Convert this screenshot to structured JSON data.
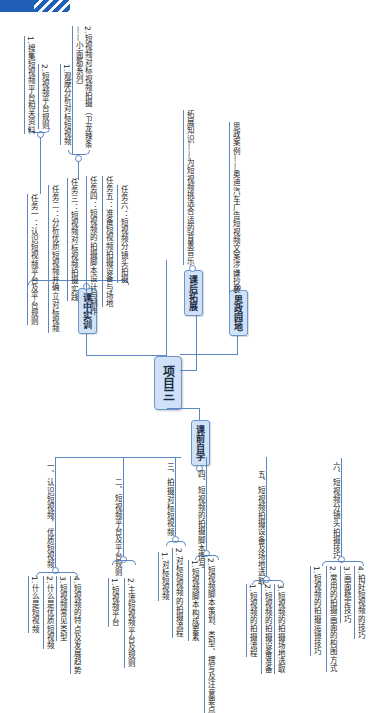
{
  "header": {
    "stripe_color": "#1f5fb8"
  },
  "center": {
    "label": "项目三"
  },
  "branches": {
    "in_class": {
      "label": "课中实训",
      "tasks": [
        "任务一：认识短视频平台及平台规则",
        "任务二：分析优质短视频并确立对标视频",
        "任务三：短视频对标视频拍摄实践",
        "任务四：短视频的拍摄脚本设计与制作",
        "任务五：准备短视频拍摄设备与场地",
        "任务六：短视频分镜头拍摄"
      ],
      "task1_sub": [
        "1.搜集短视频平台相关资料",
        "2.短视频平台规则"
      ],
      "task3_sub": [
        "1.观摩分析对标短视频",
        "2.短视频对标视频拍摄（卫龙辣条——小面筋系列）"
      ]
    },
    "after_class": {
      "label": "课后拓展",
      "item": "拓展知识——为短视频挑选合适的背景音乐"
    },
    "ideology": {
      "label": "思政园地",
      "item": "思政案例——奥迪汽车广告短视频文案涉嫌抄袭"
    },
    "pre_class": {
      "label": "课前自学",
      "sections": [
        {
          "title": "一、认识短视频，优质短视频",
          "items": [
            "1.什么是短视频",
            "2.什么是优质短视频",
            "3.短视频常见类型",
            "4.短视频的特点及发展趋势"
          ]
        },
        {
          "title": "二、短视频平台及平台规则",
          "items": [
            "1.短视频平台",
            "2.主流短视频平台及规则"
          ]
        },
        {
          "title": "三、拍摄对标短视频",
          "items": [
            "1.对标短视频",
            "2.对标短视频的拍摄流程"
          ]
        },
        {
          "title": "四、短视频的拍摄脚本撰写",
          "items": [
            "1.短视频脚本构成要素",
            "2.短视频脚本策划、类型、撰写及注意要点"
          ]
        },
        {
          "title": "五、短视频拍摄设备及场地选取",
          "items": [
            "1.短视频的拍摄流程",
            "2.短视频的拍摄设备准备",
            "3.短视频的拍摄场地选取"
          ]
        },
        {
          "title": "六、短视频分镜头拍摄技巧",
          "items": [
            "1.短视频的拍摄运镜技巧",
            "2.常用的拍摄画面的构图方式",
            "3.画面稳定技巧",
            "4.拍好短视频的技巧"
          ]
        }
      ]
    }
  }
}
